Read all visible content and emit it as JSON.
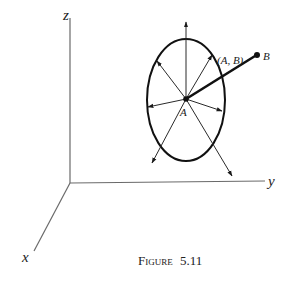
{
  "figure": {
    "caption_prefix": "Figure",
    "caption_number": "5.11",
    "axes": {
      "z_label": "z",
      "y_label": "y",
      "x_label": "x",
      "origin": [
        70,
        183
      ],
      "z_end": [
        70,
        18
      ],
      "y_end": [
        265,
        181
      ],
      "x_end": [
        34,
        251
      ]
    },
    "ellipse": {
      "cx": 186,
      "cy": 100,
      "rx": 39,
      "ry": 61
    },
    "point_A": {
      "label": "A",
      "pos": [
        186,
        99
      ]
    },
    "point_B": {
      "label": "B",
      "pos": [
        257,
        55
      ]
    },
    "segment_label": "(A, B)",
    "colors": {
      "ink": "#111111",
      "axis": "#6a6a6a",
      "background": "#ffffff"
    }
  }
}
